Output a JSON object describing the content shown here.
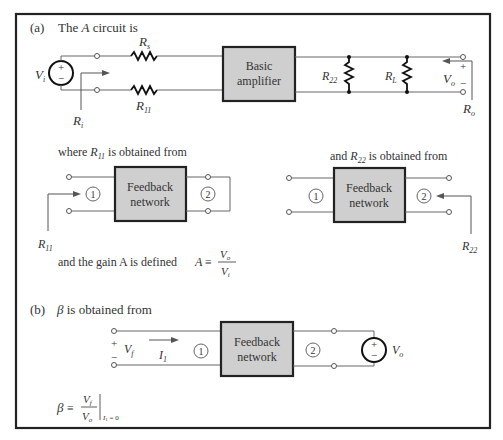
{
  "part_a": {
    "label": "(a)",
    "heading_pre": "The ",
    "heading_var": "A",
    "heading_post": " circuit is",
    "source_label": "V",
    "source_sub": "i",
    "rs_label": "R",
    "rs_sub": "s",
    "r11_label": "R",
    "r11_sub": "11",
    "ri_label": "R",
    "ri_sub": "i",
    "amp_line1": "Basic",
    "amp_line2": "amplifier",
    "r22_label": "R",
    "r22_sub": "22",
    "rl_label": "R",
    "rl_sub": "L",
    "vo_label": "V",
    "vo_sub": "o",
    "ro_label": "R",
    "ro_sub": "o",
    "plus": "+",
    "minus": "−"
  },
  "r11_sub": {
    "caption_pre": "where ",
    "caption_var": "R",
    "caption_sub": "11",
    "caption_post": " is obtained from",
    "box_line1": "Feedback",
    "box_line2": "network",
    "port1": "1",
    "port2": "2",
    "arrow_label": "R",
    "arrow_sub": "11"
  },
  "r22_sub": {
    "caption_pre": "and ",
    "caption_var": "R",
    "caption_sub": "22",
    "caption_post": " is obtained from",
    "box_line1": "Feedback",
    "box_line2": "network",
    "port1": "1",
    "port2": "2",
    "arrow_label": "R",
    "arrow_sub": "22"
  },
  "gain": {
    "text": "and the gain A is defined",
    "lhs": "A",
    "equiv": "≡",
    "num": "V",
    "num_sub": "o",
    "den": "V",
    "den_sub": "i"
  },
  "part_b": {
    "label": "(b)",
    "heading_var": "β",
    "heading_post": " is obtained from",
    "vf_label": "V",
    "vf_sub": "f",
    "i1_label": "I",
    "i1_sub": "1",
    "port1": "1",
    "port2": "2",
    "box_line1": "Feedback",
    "box_line2": "network",
    "vo_label": "V",
    "vo_sub": "o",
    "plus": "+",
    "minus": "−"
  },
  "beta_def": {
    "lhs": "β",
    "equiv": "≡",
    "num": "V",
    "num_sub": "f",
    "den": "V",
    "den_sub": "o",
    "cond_var": "I",
    "cond_sub": "1",
    "cond_rest": " = 0"
  }
}
